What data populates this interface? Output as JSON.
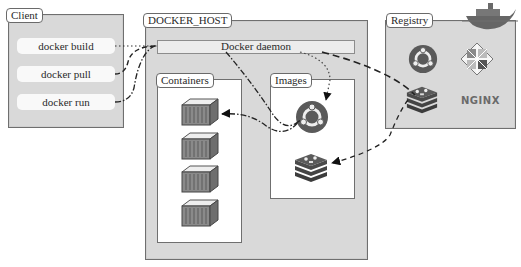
{
  "client": {
    "title": "Client",
    "commands": [
      {
        "label": "docker build"
      },
      {
        "label": "docker pull"
      },
      {
        "label": "docker run"
      }
    ]
  },
  "docker_host": {
    "title": "DOCKER_HOST",
    "daemon_label": "Docker daemon",
    "containers": {
      "title": "Containers",
      "items": [
        "container",
        "container",
        "container",
        "container"
      ]
    },
    "images": {
      "title": "Images",
      "items": [
        "ubuntu-image",
        "redis-image"
      ]
    }
  },
  "registry": {
    "title": "Registry",
    "items": [
      "ubuntu-logo",
      "centos-logo",
      "redis-logo",
      "nginx-logo"
    ],
    "nginx_text": "NGINX"
  },
  "colors": {
    "panel_bg": "#d9d9d9",
    "ubuntu": "#5a5a5a",
    "redis": "#3f3f3f"
  }
}
